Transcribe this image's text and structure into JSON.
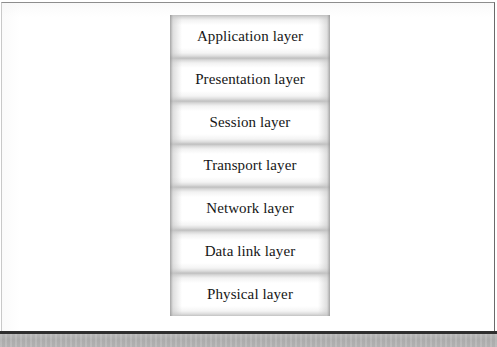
{
  "page": {
    "background_color": "#ffffff",
    "border_color_top": "#8d8d8d",
    "border_color_right": "#6a6a6a",
    "border_color_left": "#c9c9c9",
    "bottom_rule_color": "#2f2f2f",
    "gutter_color": "#b4b4b4"
  },
  "diagram": {
    "name": "osi-layer-stack",
    "orientation": "vertical-stack",
    "box_fill": "#ffffff",
    "box_edge_color": "#bdbdbd",
    "text_color": "#161616",
    "layers": [
      {
        "label": "Application layer"
      },
      {
        "label": "Presentation layer"
      },
      {
        "label": "Session layer"
      },
      {
        "label": "Transport layer"
      },
      {
        "label": "Network layer"
      },
      {
        "label": "Data link layer"
      },
      {
        "label": "Physical layer"
      }
    ]
  }
}
